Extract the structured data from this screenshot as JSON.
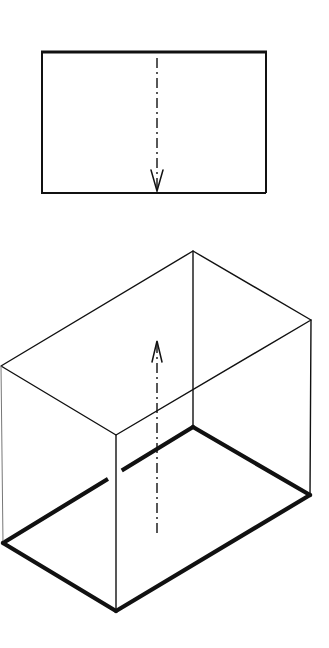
{
  "diagram": {
    "type": "technical-drawing",
    "colors": {
      "line": "#111111",
      "background": "#ffffff"
    },
    "plan_view": {
      "rect": {
        "x": 41,
        "y": 52,
        "width": 226,
        "height": 141
      },
      "axis": {
        "x": 157,
        "y1": 58,
        "y2": 192,
        "direction": "down",
        "style": "dash-dot"
      }
    },
    "isometric_box": {
      "top_face": {
        "back": [
          193,
          251
        ],
        "right": [
          311,
          320
        ],
        "front": [
          116,
          435
        ],
        "left": [
          1,
          366
        ]
      },
      "bottom_face": {
        "back": [
          193,
          427
        ],
        "right": [
          310,
          495
        ],
        "front": [
          116,
          611
        ],
        "left": [
          3,
          543
        ]
      },
      "bottom_edges_emphasized": true,
      "axis": {
        "x": 157,
        "y1": 533,
        "y2": 340,
        "direction": "up",
        "style": "dash-dot"
      }
    }
  }
}
